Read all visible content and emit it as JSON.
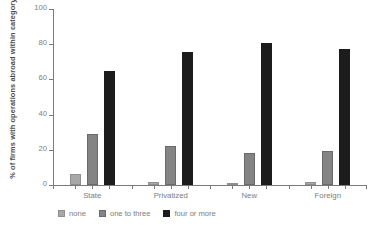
{
  "chart_data": {
    "type": "bar",
    "title": "",
    "subtitle": "",
    "xlabel": "",
    "ylabel": "% of firms with operations abroad within category",
    "categories": [
      "State",
      "Privatized",
      "New",
      "Foreign"
    ],
    "series": [
      {
        "name": "none",
        "color": "#a8a8a8",
        "values": [
          6.5,
          1.5,
          1.0,
          1.5
        ]
      },
      {
        "name": "one to three",
        "color": "#848484",
        "values": [
          29.0,
          22.0,
          18.0,
          19.5
        ]
      },
      {
        "name": "four or more",
        "color": "#1c1c1c",
        "values": [
          65.0,
          75.5,
          80.5,
          77.5
        ]
      }
    ],
    "ylim": [
      0,
      100
    ],
    "yticks": [
      0,
      20,
      40,
      60,
      80,
      100
    ],
    "ytick_labels": [
      "0",
      "20",
      "40",
      "60",
      "80",
      "100"
    ],
    "grid": false,
    "legend_position": "bottom-left",
    "legend_entries": [
      "none",
      "one to three",
      "four or more"
    ]
  }
}
